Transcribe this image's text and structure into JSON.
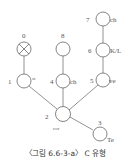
{
  "diagram": {
    "caption": "〈그림 6.6-3-a〉 C 유형",
    "nodes": [
      {
        "id": "0",
        "number": "0",
        "label": "",
        "x": 24,
        "y": 49,
        "crossed": true
      },
      {
        "id": "1",
        "number": "1",
        "label": "st",
        "x": 24,
        "y": 81,
        "crossed": false
      },
      {
        "id": "2",
        "number": "2",
        "label": "cor",
        "x": 63,
        "y": 114,
        "crossed": false
      },
      {
        "id": "3",
        "number": "3",
        "label": "Te",
        "x": 100,
        "y": 134,
        "crossed": false
      },
      {
        "id": "4",
        "number": "4",
        "label": "ch",
        "x": 63,
        "y": 81,
        "crossed": false
      },
      {
        "id": "5",
        "number": "5",
        "label": "ve",
        "x": 103,
        "y": 80,
        "crossed": false
      },
      {
        "id": "6",
        "number": "6",
        "label": "K/L",
        "x": 103,
        "y": 50,
        "crossed": false
      },
      {
        "id": "7",
        "number": "7",
        "label": "ch",
        "x": 103,
        "y": 19,
        "crossed": false
      },
      {
        "id": "8",
        "number": "8",
        "label": "",
        "x": 63,
        "y": 49,
        "crossed": false
      }
    ],
    "edges": [
      {
        "from": "0",
        "to": "1"
      },
      {
        "from": "1",
        "to": "2"
      },
      {
        "from": "8",
        "to": "4"
      },
      {
        "from": "4",
        "to": "2"
      },
      {
        "from": "7",
        "to": "6"
      },
      {
        "from": "6",
        "to": "5"
      },
      {
        "from": "5",
        "to": "2"
      },
      {
        "from": "2",
        "to": "3"
      }
    ],
    "colors": {
      "stroke": "#666666",
      "text": "#555555"
    }
  }
}
